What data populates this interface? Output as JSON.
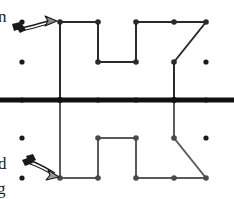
{
  "figure": {
    "type": "geometry-dot-grid",
    "canvas": {
      "width": 234,
      "height": 199
    },
    "colors": {
      "grid_dot": "#1a1a1a",
      "mirror_line": "#111111",
      "top_shape_stroke": "#2b2b2b",
      "bottom_shape_stroke": "#5a5a5a",
      "vertex_fill": "#2b2b2b",
      "arrow": "#1a1a1a",
      "background": "#ffffff"
    },
    "grid": {
      "columns_x": [
        22,
        60,
        98,
        136,
        174,
        206
      ],
      "rows_y": [
        22,
        62,
        100,
        138,
        178
      ],
      "dot_radius": 2.6
    },
    "mirror_line": {
      "name": "mirror-line",
      "y": 100,
      "x_start": 0,
      "x_end": 234,
      "thickness": 5
    },
    "top_shape": {
      "name": "pre-image-polyline",
      "stroke_width": 2,
      "points": [
        [
          60,
          100
        ],
        [
          60,
          22
        ],
        [
          98,
          22
        ],
        [
          98,
          62
        ],
        [
          136,
          62
        ],
        [
          136,
          22
        ],
        [
          174,
          22
        ],
        [
          206,
          22
        ],
        [
          174,
          62
        ],
        [
          174,
          100
        ]
      ],
      "vertex_dots": [
        [
          60,
          22
        ],
        [
          98,
          22
        ],
        [
          98,
          62
        ],
        [
          136,
          62
        ],
        [
          136,
          22
        ],
        [
          174,
          22
        ],
        [
          206,
          22
        ],
        [
          174,
          62
        ],
        [
          60,
          100
        ],
        [
          174,
          100
        ]
      ]
    },
    "bottom_shape": {
      "name": "image-polyline",
      "stroke_width": 2,
      "points": [
        [
          60,
          100
        ],
        [
          60,
          178
        ],
        [
          98,
          178
        ],
        [
          98,
          138
        ],
        [
          136,
          138
        ],
        [
          136,
          178
        ],
        [
          174,
          178
        ],
        [
          206,
          178
        ],
        [
          174,
          138
        ],
        [
          174,
          100
        ]
      ],
      "vertex_dots": [
        [
          60,
          178
        ],
        [
          98,
          178
        ],
        [
          98,
          138
        ],
        [
          136,
          138
        ],
        [
          136,
          178
        ],
        [
          174,
          178
        ],
        [
          206,
          178
        ],
        [
          174,
          138
        ]
      ]
    },
    "free_dots": [
      [
        22,
        22
      ],
      [
        22,
        62
      ],
      [
        206,
        62
      ],
      [
        22,
        138
      ],
      [
        22,
        178
      ],
      [
        206,
        138
      ]
    ],
    "arrows": [
      {
        "name": "arrow-to-pre-image",
        "from": [
          17,
          30
        ],
        "to": [
          57,
          21
        ],
        "style": "hand-drawn-tapered"
      },
      {
        "name": "arrow-to-image",
        "from": [
          50,
          160
        ],
        "to": [
          58,
          177
        ],
        "style": "hand-drawn-tapered"
      }
    ],
    "clipped_labels": [
      {
        "name": "label-fragment-n",
        "text": "n"
      },
      {
        "name": "label-fragment-d",
        "text": "d"
      },
      {
        "name": "label-fragment-g",
        "text": "g"
      }
    ]
  }
}
